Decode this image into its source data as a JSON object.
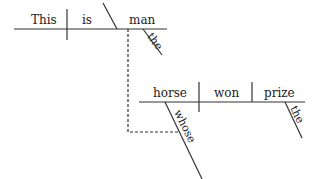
{
  "diagram": {
    "type": "sentence-diagram",
    "sentence": "This is the man whose horse won the prize",
    "main_clause": {
      "subject": "This",
      "verb": "is",
      "complement": "man",
      "modifier": "the"
    },
    "relative_clause": {
      "subject": "horse",
      "verb": "won",
      "object": "prize",
      "subject_modifier": "whose",
      "object_modifier": "the"
    },
    "line_color": "#333333"
  }
}
